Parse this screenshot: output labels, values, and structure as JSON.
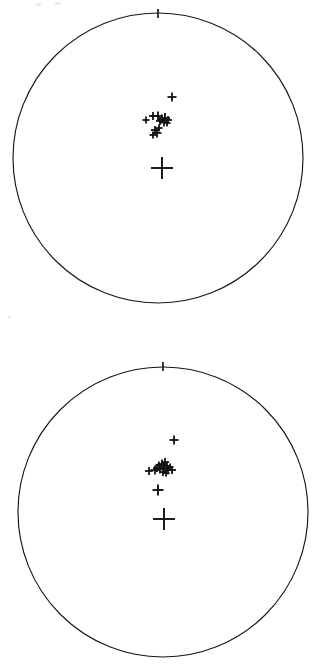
{
  "figure": {
    "background_color": "#ffffff",
    "line_color": "#171717",
    "marker_color": "#121212",
    "width": 326,
    "height": 670,
    "panel_count": 2
  },
  "panels": [
    {
      "id": "upper-stereonet",
      "name": "Upper pole figure",
      "center_x": 158,
      "center_y": 158,
      "radius": 145,
      "north_tick": {
        "x": 158,
        "y_outer": 9,
        "y_inner": 18,
        "label": "N"
      },
      "marker_count": 15
    },
    {
      "id": "lower-stereonet",
      "name": "Lower pole figure",
      "center_x": 163,
      "center_y": 512,
      "radius": 145,
      "north_tick": {
        "x": 163,
        "y_outer": 362,
        "y_inner": 371,
        "label": "N"
      },
      "marker_count": 17
    }
  ],
  "chart_data": {
    "type": "scatter",
    "subtitle": "",
    "xlabel": "",
    "ylabel": "",
    "grid": false,
    "legend": "none",
    "xlim": [
      -1,
      1
    ],
    "ylim": [
      -1,
      1
    ],
    "projection": "equal-area stereonet (lower hemisphere)",
    "marker": "plus",
    "series": [
      {
        "name": "Upper pole figure poles",
        "panel": "upper-stereonet",
        "points_px": [
          {
            "x": 172,
            "y": 97,
            "size": 9
          },
          {
            "x": 146,
            "y": 120,
            "size": 7
          },
          {
            "x": 153,
            "y": 116,
            "size": 8
          },
          {
            "x": 158,
            "y": 116,
            "size": 9
          },
          {
            "x": 162,
            "y": 119,
            "size": 9
          },
          {
            "x": 165,
            "y": 118,
            "size": 10
          },
          {
            "x": 168,
            "y": 120,
            "size": 8
          },
          {
            "x": 164,
            "y": 122,
            "size": 9
          },
          {
            "x": 160,
            "y": 121,
            "size": 8
          },
          {
            "x": 167,
            "y": 123,
            "size": 7
          },
          {
            "x": 155,
            "y": 130,
            "size": 8
          },
          {
            "x": 157,
            "y": 133,
            "size": 9
          },
          {
            "x": 153,
            "y": 135,
            "size": 7
          },
          {
            "x": 159,
            "y": 128,
            "size": 7
          },
          {
            "x": 162,
            "y": 168,
            "size": 22
          }
        ],
        "points_normalized": [
          {
            "x": 0.097,
            "y": 0.421
          },
          {
            "x": -0.083,
            "y": 0.262
          },
          {
            "x": -0.034,
            "y": 0.29
          },
          {
            "x": 0.0,
            "y": 0.29
          },
          {
            "x": 0.028,
            "y": 0.269
          },
          {
            "x": 0.048,
            "y": 0.276
          },
          {
            "x": 0.069,
            "y": 0.262
          },
          {
            "x": 0.041,
            "y": 0.248
          },
          {
            "x": 0.014,
            "y": 0.255
          },
          {
            "x": 0.062,
            "y": 0.241
          },
          {
            "x": -0.021,
            "y": 0.193
          },
          {
            "x": -0.007,
            "y": 0.172
          },
          {
            "x": -0.034,
            "y": 0.159
          },
          {
            "x": 0.007,
            "y": 0.207
          },
          {
            "x": 0.028,
            "y": -0.069
          }
        ]
      },
      {
        "name": "Lower pole figure poles",
        "panel": "lower-stereonet",
        "points_px": [
          {
            "x": 174,
            "y": 440,
            "size": 9
          },
          {
            "x": 149,
            "y": 471,
            "size": 8
          },
          {
            "x": 155,
            "y": 470,
            "size": 9
          },
          {
            "x": 160,
            "y": 469,
            "size": 9
          },
          {
            "x": 164,
            "y": 468,
            "size": 10
          },
          {
            "x": 168,
            "y": 470,
            "size": 9
          },
          {
            "x": 172,
            "y": 470,
            "size": 8
          },
          {
            "x": 162,
            "y": 464,
            "size": 9
          },
          {
            "x": 165,
            "y": 462,
            "size": 8
          },
          {
            "x": 159,
            "y": 465,
            "size": 7
          },
          {
            "x": 167,
            "y": 466,
            "size": 8
          },
          {
            "x": 170,
            "y": 467,
            "size": 7
          },
          {
            "x": 157,
            "y": 468,
            "size": 8
          },
          {
            "x": 163,
            "y": 472,
            "size": 8
          },
          {
            "x": 166,
            "y": 473,
            "size": 7
          },
          {
            "x": 158,
            "y": 490,
            "size": 11
          },
          {
            "x": 164,
            "y": 519,
            "size": 22
          }
        ],
        "points_normalized": [
          {
            "x": 0.076,
            "y": 0.497
          },
          {
            "x": -0.097,
            "y": 0.283
          },
          {
            "x": -0.055,
            "y": 0.29
          },
          {
            "x": -0.021,
            "y": 0.297
          },
          {
            "x": 0.007,
            "y": 0.303
          },
          {
            "x": 0.034,
            "y": 0.29
          },
          {
            "x": 0.062,
            "y": 0.29
          },
          {
            "x": -0.007,
            "y": 0.331
          },
          {
            "x": 0.014,
            "y": 0.345
          },
          {
            "x": -0.028,
            "y": 0.324
          },
          {
            "x": 0.028,
            "y": 0.317
          },
          {
            "x": 0.048,
            "y": 0.31
          },
          {
            "x": -0.041,
            "y": 0.303
          },
          {
            "x": 0.0,
            "y": 0.276
          },
          {
            "x": 0.021,
            "y": 0.269
          },
          {
            "x": -0.034,
            "y": 0.152
          },
          {
            "x": 0.007,
            "y": -0.048
          }
        ]
      }
    ]
  },
  "artifacts": {
    "specks": [
      {
        "x": 36,
        "y": 3,
        "w": 5,
        "h": 3
      },
      {
        "x": 55,
        "y": 2,
        "w": 6,
        "h": 3
      },
      {
        "x": 8,
        "y": 316,
        "w": 3,
        "h": 3
      }
    ]
  }
}
